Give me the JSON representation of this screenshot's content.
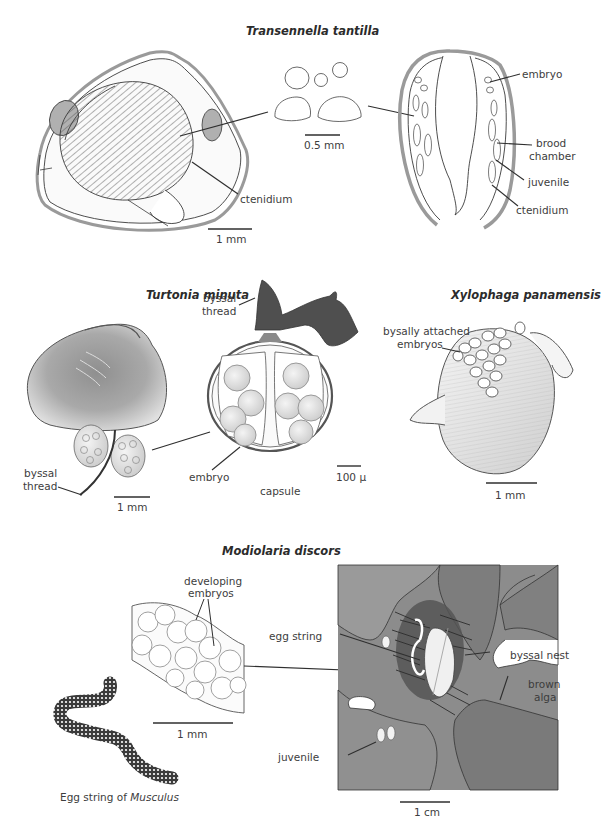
{
  "panels": {
    "transennella": {
      "title": "Transennella tantilla",
      "labels": {
        "ctenidium_left": "ctenidium",
        "embryo": "embryo",
        "brood_chamber_1": "brood",
        "brood_chamber_2": "chamber",
        "juvenile": "juvenile",
        "ctenidium_right": "ctenidium"
      },
      "scale_bars": {
        "shell": "1 mm",
        "juveniles": "0.5 mm"
      }
    },
    "turtonia": {
      "title": "Turtonia minuta",
      "labels": {
        "byssal_thread_top_1": "byssal",
        "byssal_thread_top_2": "thread",
        "byssal_thread_bottom_1": "byssal",
        "byssal_thread_bottom_2": "thread",
        "embryo": "embryo",
        "capsule": "capsule"
      },
      "scale_bars": {
        "shell": "1 mm",
        "capsule": "100 µ"
      }
    },
    "xylophaga": {
      "title": "Xylophaga panamensis",
      "labels": {
        "embryos_1": "bysally attached",
        "embryos_2": "embryos"
      },
      "scale_bars": {
        "shell": "1 mm"
      }
    },
    "modiolaria": {
      "title": "Modiolaria discors",
      "labels": {
        "developing_1": "developing",
        "developing_2": "embryos",
        "egg_string": "egg string",
        "byssal_nest": "byssal nest",
        "brown_alga_1": "brown",
        "brown_alga_2": "alga",
        "juvenile": "juvenile"
      },
      "scale_bars": {
        "string_detail": "1 mm",
        "nest": "1 cm"
      }
    },
    "musculus": {
      "caption_prefix": "Egg string of ",
      "caption_genus": "Musculus"
    }
  },
  "colors": {
    "outline": "#3a3a3a",
    "shell_gray": "#9a9a9a",
    "light_fill": "#f2f2f2",
    "mid_gray": "#b8b8b8",
    "alga_gray": "#8c8c8c",
    "alga_dark": "#6e6e6e",
    "thread_dark": "#4a4a4a"
  }
}
